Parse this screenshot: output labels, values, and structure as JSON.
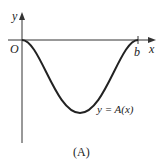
{
  "figure": {
    "y_axis_label": "y",
    "x_axis_label": "x",
    "origin_label": "O",
    "b_label": "b",
    "curve_label": "y = A(x)",
    "caption": "(A)"
  },
  "colors": {
    "ink": "#222222"
  }
}
